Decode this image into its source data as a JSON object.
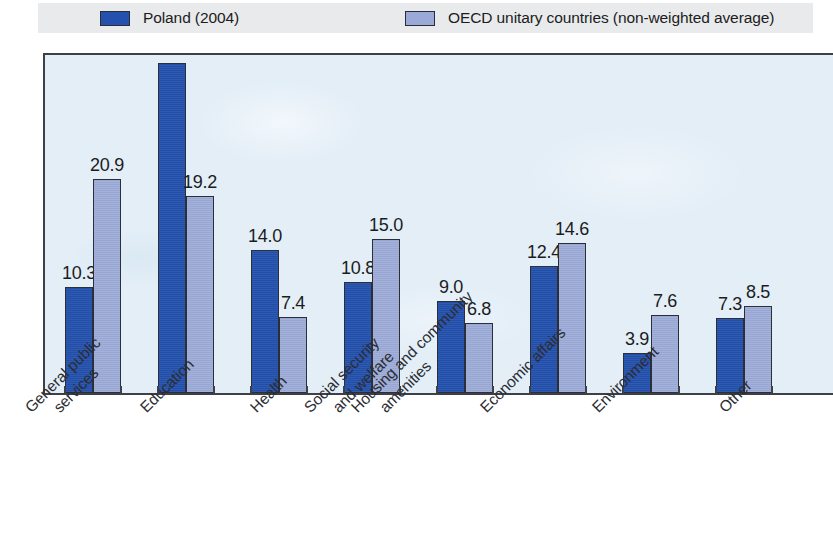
{
  "legend": {
    "entries": [
      {
        "label": "Poland (2004)",
        "color": "#2451ad",
        "swatch_name": "legend-swatch-poland"
      },
      {
        "label": "OECD unitary countries (non-weighted average)",
        "color": "#9aa9d6",
        "swatch_name": "legend-swatch-oecd"
      }
    ]
  },
  "chart_data": {
    "type": "bar",
    "title": "",
    "subtitle": "",
    "xlabel": "",
    "ylabel": "",
    "ylim": [
      0,
      34
    ],
    "grid": false,
    "legend_position": "top",
    "categories": [
      "General public services",
      "Education",
      "Health",
      "Social security and welfare",
      "Housing and community amenities",
      "Economic affairs",
      "Environment",
      "Other"
    ],
    "category_lines": [
      [
        "General public",
        "services"
      ],
      [
        "Education"
      ],
      [
        "Health"
      ],
      [
        "Social security",
        "and welfare"
      ],
      [
        "Housing and community",
        "amenities"
      ],
      [
        "Economic affairs"
      ],
      [
        "Environment"
      ],
      [
        "Other"
      ]
    ],
    "series": [
      {
        "name": "Poland (2004)",
        "color": "#2451ad",
        "values": [
          10.3,
          32.2,
          14.0,
          10.8,
          9.0,
          12.4,
          3.9,
          7.3
        ],
        "labels": [
          "10.3",
          "32.2",
          "14.0",
          "10.8",
          "9.0",
          "12.4",
          "3.9",
          "7.3"
        ]
      },
      {
        "name": "OECD unitary countries (non-weighted average)",
        "color": "#9aa9d6",
        "values": [
          20.9,
          19.2,
          7.4,
          15.0,
          6.8,
          14.6,
          7.6,
          8.5
        ],
        "labels": [
          "20.9",
          "19.2",
          "7.4",
          "15.0",
          "6.8",
          "14.6",
          "7.6",
          "8.5"
        ]
      }
    ]
  },
  "colors": {
    "plot_background": "#e3eef7",
    "legend_band": "#e9eaeb",
    "axis": "#3d4046",
    "text": "#1b1c22"
  }
}
